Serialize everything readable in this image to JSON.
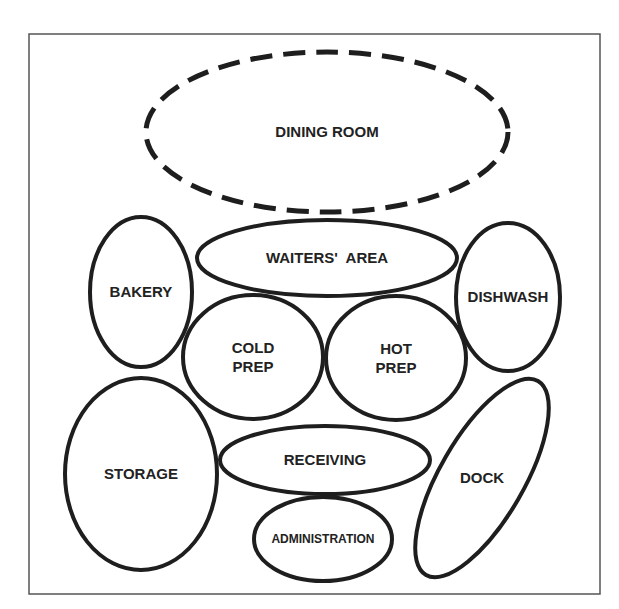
{
  "diagram": {
    "type": "bubble-adjacency-diagram",
    "frame": {
      "x": 29,
      "y": 34,
      "width": 571,
      "height": 560,
      "stroke": "#555555"
    },
    "colors": {
      "stroke": "#1e1e1e",
      "text": "#222222",
      "background": "#ffffff"
    },
    "areas": [
      {
        "id": "dining-room",
        "label_lines": [
          "DINING ROOM"
        ],
        "cx": 327,
        "cy": 132,
        "rx": 181,
        "ry": 80,
        "rotate": 0,
        "dashed": true,
        "font_size": 15
      },
      {
        "id": "waiters-area",
        "label_lines": [
          "WAITERS'  AREA"
        ],
        "cx": 327,
        "cy": 258,
        "rx": 130,
        "ry": 38,
        "rotate": 0,
        "dashed": false,
        "font_size": 15
      },
      {
        "id": "bakery",
        "label_lines": [
          "BAKERY"
        ],
        "cx": 141,
        "cy": 292,
        "rx": 51,
        "ry": 75,
        "rotate": 0,
        "dashed": false,
        "font_size": 15
      },
      {
        "id": "dishwash",
        "label_lines": [
          "DISHWASH"
        ],
        "cx": 508,
        "cy": 297,
        "rx": 52,
        "ry": 74,
        "rotate": 0,
        "dashed": false,
        "font_size": 15
      },
      {
        "id": "cold-prep",
        "label_lines": [
          "COLD",
          "PREP"
        ],
        "cx": 253,
        "cy": 357,
        "rx": 70,
        "ry": 62,
        "rotate": 0,
        "dashed": false,
        "font_size": 15
      },
      {
        "id": "hot-prep",
        "label_lines": [
          "HOT",
          "PREP"
        ],
        "cx": 396,
        "cy": 358,
        "rx": 70,
        "ry": 62,
        "rotate": 0,
        "dashed": false,
        "font_size": 15
      },
      {
        "id": "storage",
        "label_lines": [
          "STORAGE"
        ],
        "cx": 141,
        "cy": 474,
        "rx": 76,
        "ry": 96,
        "rotate": 0,
        "dashed": false,
        "font_size": 15
      },
      {
        "id": "receiving",
        "label_lines": [
          "RECEIVING"
        ],
        "cx": 325,
        "cy": 460,
        "rx": 105,
        "ry": 34,
        "rotate": 0,
        "dashed": false,
        "font_size": 15
      },
      {
        "id": "administration",
        "label_lines": [
          "ADMINISTRATION"
        ],
        "cx": 323,
        "cy": 539,
        "rx": 69,
        "ry": 42,
        "rotate": 0,
        "dashed": false,
        "font_size": 12
      },
      {
        "id": "dock",
        "label_lines": [
          "DOCK"
        ],
        "cx": 482,
        "cy": 478,
        "rx": 42,
        "ry": 112,
        "rotate": 30,
        "dashed": false,
        "font_size": 15
      }
    ]
  }
}
